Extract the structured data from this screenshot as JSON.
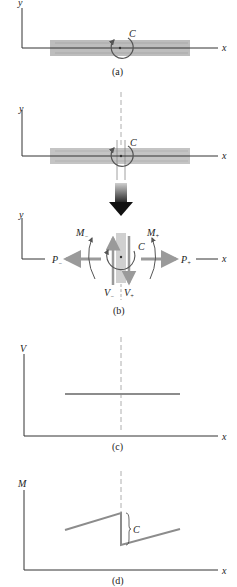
{
  "panels": {
    "a": {
      "caption": "(a)",
      "y_label": "y",
      "x_label": "x",
      "couple_label": "C"
    },
    "b": {
      "caption": "(b)",
      "y_label": "y",
      "x_label": "x",
      "couple_label": "C",
      "labels": {
        "m_minus": "M",
        "m_minus_sub": "−",
        "m_plus": "M",
        "m_plus_sub": "+",
        "p_minus": "P",
        "p_minus_sub": "−",
        "p_plus": "P",
        "p_plus_sub": "+",
        "v_minus": "V",
        "v_minus_sub": "−",
        "v_plus": "V",
        "v_plus_sub": "+"
      }
    },
    "c": {
      "caption": "(c)",
      "y_label": "V",
      "x_label": "x"
    },
    "d": {
      "caption": "(d)",
      "y_label": "M",
      "x_label": "x",
      "jump_label": "C"
    }
  },
  "colors": {
    "axis": "#333333",
    "beam": "#b5b5b5",
    "force": "#9a9a9a",
    "dark_arrow": "#2a2a2a",
    "diagram_line": "#8c8c8c"
  }
}
